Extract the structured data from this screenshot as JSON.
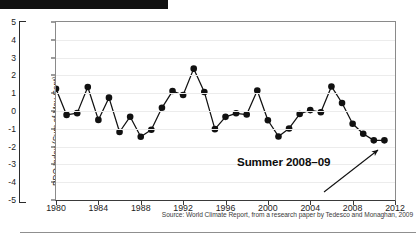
{
  "figure": {
    "top_bar": "black-redaction-bar",
    "source_note": "Source: World Climate Report, from a research paper by Tedesco and Monaghan, 2009",
    "annotation": {
      "label": "Summer 2008–09",
      "arrow": "arrow-pointing-up-right-to-last-point"
    },
    "colors": {
      "line": "#111111",
      "marker": "#111111",
      "grid": "#ececec",
      "axis": "#8a8a8a",
      "text": "#1c1c1c",
      "top_bar": "#111111"
    }
  },
  "chart_data": {
    "type": "line",
    "title": "",
    "xlabel": "",
    "ylabel": "PDO Index (Sum of May-Sept)",
    "xlim": [
      1980,
      2012
    ],
    "ylim": [
      -5,
      5
    ],
    "grid": true,
    "legend": false,
    "xticks": [
      1980,
      1984,
      1988,
      1992,
      1996,
      2000,
      2004,
      2008,
      2012
    ],
    "xtick_labels": [
      "1980",
      "1984",
      "1988",
      "1992",
      "1996",
      "2000",
      "2004",
      "2008",
      "2012"
    ],
    "yticks": [
      5,
      4,
      3,
      2,
      1,
      0,
      -1,
      -2,
      -3,
      -4,
      -5
    ],
    "ytick_labels": [
      "5",
      "4",
      "3",
      "2",
      "1",
      "0",
      "-1",
      "-2",
      "-3",
      "-4",
      "-5"
    ],
    "marker": "circle-filled",
    "x": [
      1980,
      1981,
      1982,
      1983,
      1984,
      1985,
      1986,
      1987,
      1988,
      1989,
      1990,
      1991,
      1992,
      1993,
      1994,
      1995,
      1996,
      1997,
      1998,
      1999,
      2000,
      2001,
      2002,
      2003,
      2004,
      2005,
      2006,
      2007,
      2008,
      2009,
      2010,
      2011
    ],
    "values": [
      1.25,
      -0.22,
      -0.12,
      1.35,
      -0.5,
      0.75,
      -1.18,
      -0.32,
      -1.45,
      -1.05,
      0.18,
      1.12,
      0.9,
      2.38,
      1.07,
      -1.02,
      -0.33,
      -0.13,
      -0.2,
      1.15,
      -0.52,
      -1.43,
      -0.98,
      -0.17,
      0.05,
      -0.07,
      1.38,
      0.45,
      -0.72,
      -1.28,
      -1.65,
      -1.65
    ],
    "series": [
      {
        "name": "PDO Index (Sum of May-Sept)",
        "values": [
          1.25,
          -0.22,
          -0.12,
          1.35,
          -0.5,
          0.75,
          -1.18,
          -0.32,
          -1.45,
          -1.05,
          0.18,
          1.12,
          0.9,
          2.38,
          1.07,
          -1.02,
          -0.33,
          -0.13,
          -0.2,
          1.15,
          -0.52,
          -1.43,
          -0.98,
          -0.17,
          0.05,
          -0.07,
          1.38,
          0.45,
          -0.72,
          -1.28,
          -1.65,
          -1.65
        ]
      }
    ],
    "annotations": [
      {
        "text": "Summer 2008–09",
        "points_to_x": 2011,
        "points_to_y": -1.65
      }
    ]
  }
}
